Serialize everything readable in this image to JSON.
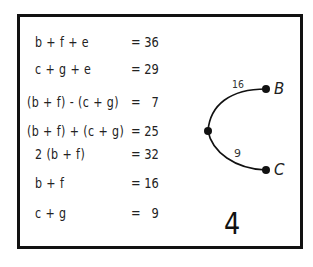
{
  "equations": [
    {
      "lhs": "b + f + e",
      "rhs": "= 36"
    },
    {
      "lhs": "c + g + e",
      "rhs": "= 29"
    },
    {
      "lhs": "(b + f) - (c + g)",
      "rhs": "=   7"
    },
    {
      "lhs": "(b + f) + (c + g)",
      "rhs": "= 25"
    },
    {
      "lhs": "2 (b + f)",
      "rhs": "= 32"
    },
    {
      "lhs": "b + f",
      "rhs": "= 16"
    },
    {
      "lhs": "c + g",
      "rhs": "=   9"
    }
  ],
  "graph": {
    "upper_edge_label": "16",
    "lower_edge_label": "9",
    "node_b_label": "B",
    "node_c_label": "C"
  },
  "panel_number": "4"
}
